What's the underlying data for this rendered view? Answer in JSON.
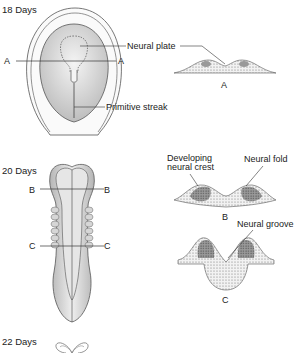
{
  "stages": [
    {
      "day_label": "18 Days",
      "section_labels": [
        "A",
        "A"
      ],
      "annotations": [
        "Neural plate",
        "Primitive streak"
      ],
      "cross_section": "A"
    },
    {
      "day_label": "20 Days",
      "section_labels": [
        "B",
        "B",
        "C",
        "C"
      ],
      "annotations": [
        "Developing neural crest",
        "Neural fold",
        "Neural groove"
      ],
      "cross_sections": [
        "B",
        "C"
      ]
    },
    {
      "day_label": "22 Days"
    }
  ],
  "labels": {
    "day18": "18 Days",
    "day20": "20 Days",
    "day22": "22 Days",
    "A": "A",
    "B": "B",
    "C": "C",
    "neural_plate": "Neural plate",
    "primitive_streak": "Primitive streak",
    "developing_line1": "Developing",
    "developing_line2": "neural crest",
    "neural_fold": "Neural fold",
    "neural_groove": "Neural groove"
  },
  "colors": {
    "line": "#333333",
    "fill_light": "#e8e8e8",
    "fill_mid": "#cfcfcf",
    "fill_dark": "#8a8a8a"
  }
}
